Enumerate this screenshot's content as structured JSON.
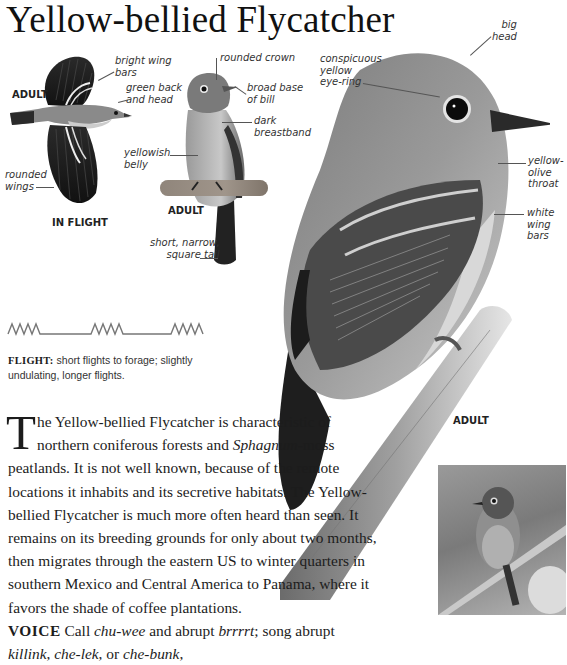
{
  "page": {
    "title": "Yellow-bellied Flycatcher"
  },
  "illustrations": {
    "in_flight": {
      "age_label": "ADULT",
      "caption": "IN FLIGHT",
      "annotations": {
        "wing_bars": "bright wing\nbars",
        "back_head": "green back\nand head",
        "wings": "rounded\nwings"
      }
    },
    "perched_small": {
      "caption": "ADULT",
      "annotations": {
        "crown": "rounded crown",
        "bill": "broad base\nof bill",
        "breastband": "dark\nbreastband",
        "belly": "yellowish\nbelly",
        "tail": "short, narrow,\nsquare tail"
      }
    },
    "perched_large": {
      "caption": "ADULT",
      "annotations": {
        "head": "big\nhead",
        "eye_ring": "conspicuous\nyellow\neye-ring",
        "throat": "yellow-\nolive\nthroat",
        "wing_bars": "white\nwing\nbars"
      }
    },
    "photo": {
      "icon": "bird-photo"
    }
  },
  "flight": {
    "pattern_icon": "undulating-flight-pattern",
    "label": "FLIGHT:",
    "text": "short flights to forage; slightly undulating, longer flights."
  },
  "description": {
    "dropcap": "T",
    "p1": "he Yellow-bellied Flycatcher is characteristic of northern coniferous forests and ",
    "p1_italic": "Sphagnum",
    "p2": "-moss peatlands. It is not well known, because of the remote locations it inhabits and its secretive habitats. The Yellow-bellied Flycatcher is much more often heard than seen. It remains on its breeding grounds for only about two months, then migrates through the eastern US to winter quarters in southern Mexico and Central America to Panama, where it favors the shade of coffee plantations.",
    "voice_label": "VOICE",
    "voice_1": " Call ",
    "voice_call1": "chu-wee",
    "voice_2": " and abrupt ",
    "voice_call2": "brrrrt",
    "voice_3": "; song abrupt ",
    "voice_song1": "killink",
    "voice_4": ", ",
    "voice_song2": "che-lek",
    "voice_5": ", or ",
    "voice_song3": "che-bunk",
    "voice_6": ","
  }
}
